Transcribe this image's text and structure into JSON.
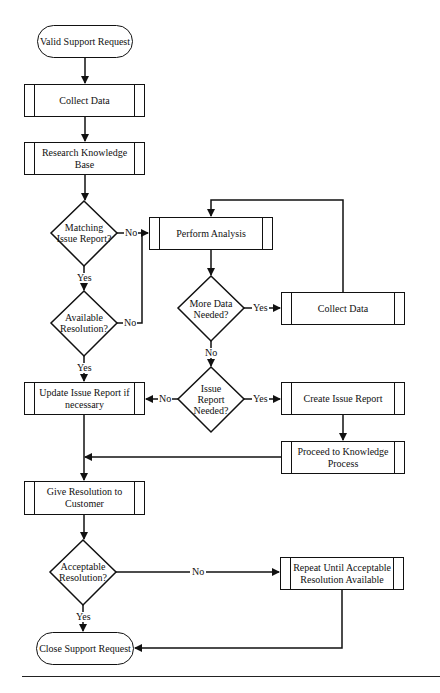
{
  "diagram": {
    "type": "flowchart",
    "nodes": {
      "start": "Valid Support Request",
      "collect_data_1": "Collect Data",
      "research_kb": "Research Knowledge Base",
      "matching_issue": "Matching Issue Report?",
      "available_resolution": "Available Resolution?",
      "perform_analysis": "Perform Analysis",
      "more_data_needed": "More Data Needed?",
      "collect_data_2": "Collect Data",
      "issue_report_needed": "Issue Report Needed?",
      "update_issue_report": "Update Issue Report if necessary",
      "create_issue_report": "Create Issue Report",
      "proceed_knowledge": "Proceed to Knowledge Process",
      "give_resolution": "Give Resolution to Customer",
      "acceptable_resolution": "Acceptable Resolution?",
      "repeat_until": "Repeat Until Acceptable Resolution Available",
      "end": "Close Support Request"
    },
    "labels": {
      "yes": "Yes",
      "no": "No"
    },
    "edges": [
      {
        "from": "start",
        "to": "collect_data_1",
        "label": ""
      },
      {
        "from": "collect_data_1",
        "to": "research_kb",
        "label": ""
      },
      {
        "from": "research_kb",
        "to": "matching_issue",
        "label": ""
      },
      {
        "from": "matching_issue",
        "to": "available_resolution",
        "label": "Yes"
      },
      {
        "from": "matching_issue",
        "to": "perform_analysis",
        "label": "No"
      },
      {
        "from": "available_resolution",
        "to": "perform_analysis",
        "label": "No"
      },
      {
        "from": "available_resolution",
        "to": "update_issue_report",
        "label": "Yes"
      },
      {
        "from": "perform_analysis",
        "to": "more_data_needed",
        "label": ""
      },
      {
        "from": "more_data_needed",
        "to": "collect_data_2",
        "label": "Yes"
      },
      {
        "from": "collect_data_2",
        "to": "perform_analysis",
        "label": ""
      },
      {
        "from": "more_data_needed",
        "to": "issue_report_needed",
        "label": "No"
      },
      {
        "from": "issue_report_needed",
        "to": "create_issue_report",
        "label": "Yes"
      },
      {
        "from": "issue_report_needed",
        "to": "update_issue_report",
        "label": "No"
      },
      {
        "from": "create_issue_report",
        "to": "proceed_knowledge",
        "label": ""
      },
      {
        "from": "proceed_knowledge",
        "to": "give_resolution",
        "label": ""
      },
      {
        "from": "update_issue_report",
        "to": "give_resolution",
        "label": ""
      },
      {
        "from": "give_resolution",
        "to": "acceptable_resolution",
        "label": ""
      },
      {
        "from": "acceptable_resolution",
        "to": "end",
        "label": "Yes"
      },
      {
        "from": "acceptable_resolution",
        "to": "repeat_until",
        "label": "No"
      },
      {
        "from": "repeat_until",
        "to": "end",
        "label": ""
      }
    ]
  }
}
